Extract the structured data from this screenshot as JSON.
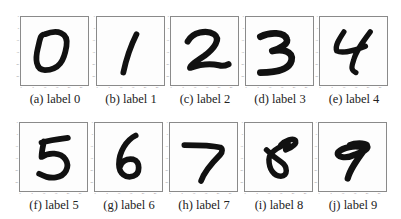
{
  "figure": {
    "panels": [
      {
        "id": "a",
        "caption": "(a) label 0",
        "digit": "0"
      },
      {
        "id": "b",
        "caption": "(b) label 1",
        "digit": "1"
      },
      {
        "id": "c",
        "caption": "(c) label 2",
        "digit": "2"
      },
      {
        "id": "d",
        "caption": "(d) label 3",
        "digit": "3"
      },
      {
        "id": "e",
        "caption": "(e) label 4",
        "digit": "4"
      },
      {
        "id": "f",
        "caption": "(f) label 5",
        "digit": "5"
      },
      {
        "id": "g",
        "caption": "(g) label 6",
        "digit": "6"
      },
      {
        "id": "h",
        "caption": "(h) label 7",
        "digit": "7"
      },
      {
        "id": "i",
        "caption": "(i) label 8",
        "digit": "8"
      },
      {
        "id": "j",
        "caption": "(j) label 9",
        "digit": "9"
      }
    ],
    "axis_ticks": [
      "0",
      "5",
      "10",
      "15",
      "20",
      "25"
    ],
    "stroke_color": "#111111",
    "frame_color": "#8a8a8a"
  }
}
